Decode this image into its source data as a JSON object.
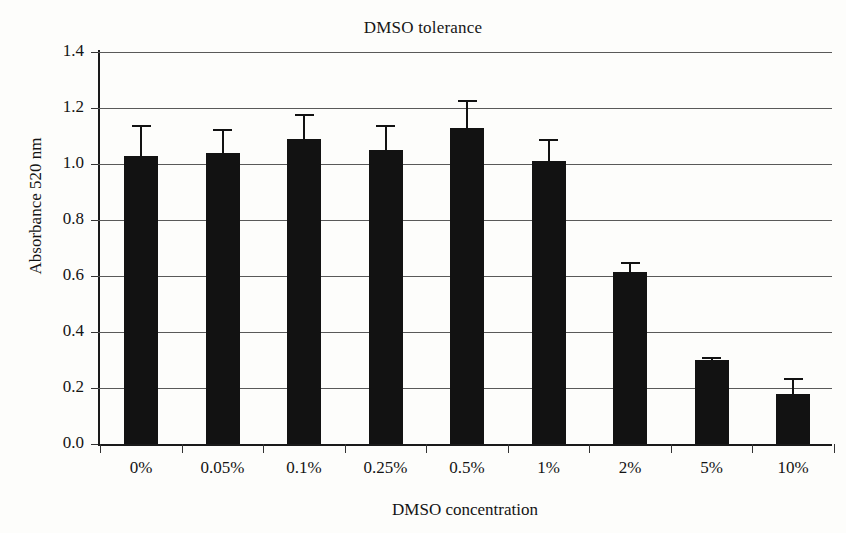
{
  "chart_data": {
    "type": "bar",
    "title": "DMSO tolerance",
    "xlabel": "DMSO concentration",
    "ylabel": "Absorbance 520 nm",
    "categories": [
      "0%",
      "0.05%",
      "0.1%",
      "0.25%",
      "0.5%",
      "1%",
      "2%",
      "5%",
      "10%"
    ],
    "values": [
      1.03,
      1.04,
      1.09,
      1.05,
      1.13,
      1.01,
      0.615,
      0.3,
      0.18
    ],
    "errors": [
      0.11,
      0.085,
      0.09,
      0.09,
      0.1,
      0.08,
      0.035,
      0.01,
      0.055
    ],
    "ylim": [
      0.0,
      1.4
    ],
    "yticks": [
      "0.0",
      "0.2",
      "0.4",
      "0.6",
      "0.8",
      "1.0",
      "1.2",
      "1.4"
    ],
    "ytick_values": [
      0.0,
      0.2,
      0.4,
      0.6,
      0.8,
      1.0,
      1.2,
      1.4
    ],
    "grid": true,
    "legend": false,
    "bar_color": "#121212",
    "grid_color": "#595959",
    "axis_color": "#1a1a1a"
  }
}
